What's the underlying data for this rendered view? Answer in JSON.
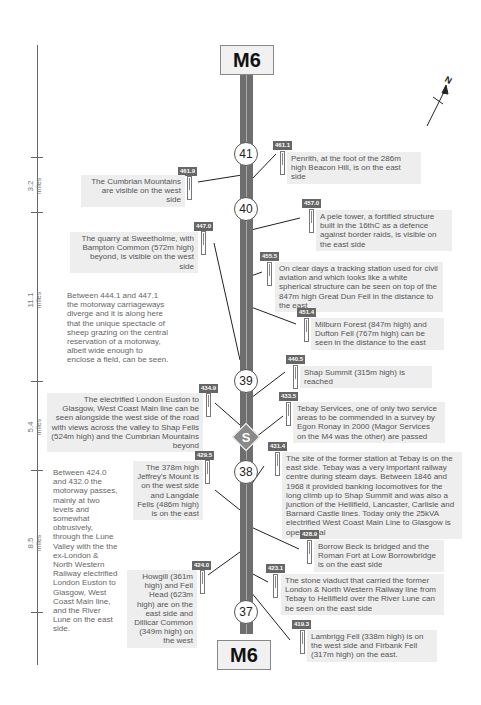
{
  "road": {
    "name_top": "M6",
    "name_bottom": "M6",
    "color": "#6e6e6e",
    "junctions": [
      {
        "label": "41",
        "y": 140
      },
      {
        "label": "40",
        "y": 200
      },
      {
        "label": "39",
        "y": 370
      },
      {
        "label": "38",
        "y": 472
      },
      {
        "label": "37",
        "y": 604
      }
    ],
    "services": {
      "label": "S"
    }
  },
  "scale": {
    "segments": [
      {
        "value": "3.2",
        "unit": "miles"
      },
      {
        "value": "11.1",
        "unit": "miles"
      },
      {
        "value": "5.4",
        "unit": "miles"
      },
      {
        "value": "8.5",
        "unit": "miles"
      }
    ]
  },
  "compass": {
    "label": "N"
  },
  "notes": [
    {
      "marker": "461.1",
      "side": "east",
      "text": "Penrith, at the foot of the 286m high Beacon Hill, is on the east side"
    },
    {
      "marker": "461.9",
      "side": "west",
      "text": "The Cumbrian Mountains are visible on the west side"
    },
    {
      "marker": "457.0",
      "side": "east",
      "text": "A pele tower, a fortified structure built in the 16thC as a defence against border raids, is visible on the east side"
    },
    {
      "marker": "447.0",
      "side": "west",
      "text": "The quarry at Sweetholme, with Bampton Common (572m high) beyond, is visible on the west side"
    },
    {
      "marker": "455.5",
      "side": "east",
      "text": "On clear days a tracking station used for civil aviation and which looks like a white spherical structure can be seen on top of the 847m high Great Dun Fell in the distance to the east"
    },
    {
      "marker": "451.4",
      "side": "east",
      "text": "Milburn Forest (847m high) and Dufton Fell (767m high) can be seen in the distance to the east"
    },
    {
      "marker": "440.5",
      "side": "east",
      "text": "Shap Summit (315m high) is reached"
    },
    {
      "marker": "434.9",
      "side": "west",
      "text": "The electrified London Euston to Glasgow, West Coast Main line can be seen alongside the west side of the road with views across the valley to Shap Fells (524m high) and the Cumbrian Mountains beyond"
    },
    {
      "marker": "433.5",
      "side": "east",
      "text": "Tebay Services, one of only two service areas to be commended in a survey by Egon Ronay in 2000 (Magor Services on the M4 was the other) are passed"
    },
    {
      "marker": "431.4",
      "side": "east",
      "text": "The site of the former station at Tebay is on the east side. Tebay was a very important railway centre during steam days. Between 1846 and 1968 it provided banking locomotives for the long climb up to Shap Summit and was also a junction of the Hellifield, Lancaster, Carlisle and Barnard Castle lines. Today only the 25kVA electrified West Coast Main Line to Glasgow is operational"
    },
    {
      "marker": "429.5",
      "side": "west",
      "text": "The 378m high Jeffrey's Mount is on the west side and Langdale Fells (486m high) is on the east"
    },
    {
      "marker": "428.9",
      "side": "east",
      "text": "Borrow Beck is bridged and the Roman Fort at Low Borrowbridge is on the east side"
    },
    {
      "marker": "424.0",
      "side": "west",
      "text": "Howgill (361m high) and Fell Head (623m high) are on the east side and Dillicar Common (349m high) on the west"
    },
    {
      "marker": "423.1",
      "side": "east",
      "text": "The stone viaduct that carried the former London & North Western Railway line from Tebay to Hellifield over the River Lune can be seen on the east side"
    },
    {
      "marker": "419.3",
      "side": "east",
      "text": "Lambrigg Fell (338m high) is on the west side and Firbank Fell (317m high) on the east."
    }
  ],
  "section_notes": [
    {
      "text": "Between 444.1 and 447.1 the motorway carriageways diverge and it is along here that the unique spectacle of sheep grazing on the central reservation of a motorway, albeit wide enough to enclose a field, can be seen."
    },
    {
      "text": "Between 424.0 and 432.0 the motorway passes, mainly at two levels and somewhat obtrusively, through the Lune Valley with the the ex-London & North Western Railway electrified London Euston to Glasgow, West Coast Main line, and the River Lune on the east side."
    }
  ]
}
